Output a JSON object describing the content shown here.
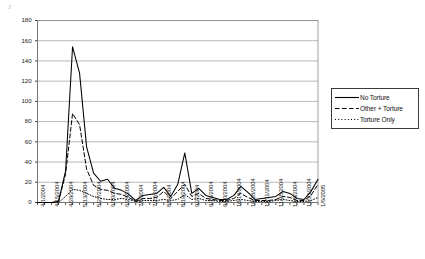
{
  "chart_data": {
    "type": "line",
    "title": "",
    "xlabel": "",
    "ylabel": "",
    "ylim": [
      0,
      180
    ],
    "ytick_step": 20,
    "grid": true,
    "grid_axis": "y",
    "legend_position": "right",
    "yticks": [
      "0",
      "20",
      "40",
      "60",
      "80",
      "100",
      "120",
      "140",
      "160",
      "180"
    ],
    "categories": [
      "4/1/2004",
      "4/8/2004",
      "4/15/2004",
      "4/22/2004",
      "4/29/2004",
      "5/6/2004",
      "5/13/2004",
      "5/20/2004",
      "5/27/2004",
      "6/3/2004",
      "6/10/2004",
      "6/17/2004",
      "6/24/2004",
      "7/1/2004",
      "7/8/2004",
      "7/15/2004",
      "7/22/2004",
      "7/29/2004",
      "8/5/2004",
      "8/12/2004",
      "8/19/2004",
      "8/26/2004",
      "9/2/2004",
      "9/9/2004",
      "9/16/2004",
      "9/23/2004",
      "9/30/2004",
      "10/7/2004",
      "10/14/2004",
      "10/21/2004",
      "10/28/2004",
      "11/4/2004",
      "11/11/2004",
      "11/18/2004",
      "11/25/2004",
      "12/2/2004",
      "12/9/2004",
      "12/16/2004",
      "12/23/2004",
      "12/30/2004",
      "1/6/2005"
    ],
    "xtick_labels": [
      "4/1/2004",
      "4/15/2004",
      "4/29/2004",
      "5/13/2004",
      "5/27/2004",
      "6/10/2004",
      "6/24/2004",
      "7/8/2004",
      "7/22/2004",
      "8/5/2004",
      "8/19/2004",
      "9/2/2004",
      "9/16/2004",
      "9/30/2004",
      "10/14/2004",
      "10/28/2004",
      "11/11/2004",
      "11/25/2004",
      "12/9/2004",
      "12/23/2004",
      "1/6/2005"
    ],
    "series": [
      {
        "name": "No Torture",
        "style": "solid",
        "color": "#000000",
        "values": [
          0,
          0,
          0,
          1,
          31,
          154,
          128,
          55,
          29,
          21,
          23,
          14,
          12,
          8,
          2,
          7,
          8,
          9,
          15,
          6,
          18,
          49,
          9,
          14,
          7,
          5,
          3,
          3,
          7,
          16,
          10,
          3,
          4,
          5,
          6,
          11,
          9,
          4,
          3,
          11,
          23
        ]
      },
      {
        "name": "Other + Torture",
        "style": "dashed",
        "color": "#000000",
        "values": [
          0,
          0,
          0,
          1,
          28,
          88,
          77,
          33,
          17,
          13,
          12,
          9,
          8,
          5,
          1,
          4,
          4,
          5,
          11,
          4,
          11,
          18,
          6,
          9,
          4,
          3,
          2,
          2,
          4,
          9,
          5,
          2,
          2,
          2,
          3,
          6,
          5,
          2,
          2,
          7,
          18
        ]
      },
      {
        "name": "Torture Only",
        "style": "dotted",
        "color": "#000000",
        "values": [
          0,
          0,
          0,
          0,
          6,
          13,
          12,
          9,
          6,
          4,
          3,
          3,
          4,
          3,
          1,
          2,
          2,
          2,
          3,
          2,
          3,
          8,
          3,
          4,
          2,
          2,
          1,
          1,
          2,
          3,
          2,
          1,
          1,
          1,
          2,
          3,
          2,
          1,
          1,
          2,
          5
        ]
      }
    ]
  },
  "legend": {
    "items": [
      {
        "label": "No Torture",
        "style": "solid"
      },
      {
        "label": "Other + Torture",
        "style": "dashed"
      },
      {
        "label": "Torture Only",
        "style": "dotted"
      }
    ]
  }
}
